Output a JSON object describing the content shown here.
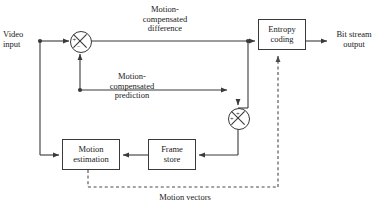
{
  "diagram": {
    "colors": {
      "line": "#3a3a3a",
      "box_stroke": "#3a3a3a",
      "box_fill": "#ffffff",
      "text": "#1a1a1a",
      "dashed": "#4a4a4a"
    },
    "labels": {
      "video_input": "Video\ninput",
      "mc_difference": "Motion-\ncompensated\ndifference",
      "mc_prediction": "Motion-\ncompensated\nprediction",
      "bit_stream_output": "Bit stream\noutput",
      "motion_vectors": "Motion vectors"
    },
    "blocks": [
      {
        "id": "entropy_coding",
        "label": "Entropy\ncoding",
        "x": 258,
        "y": 19,
        "w": 48,
        "h": 31
      },
      {
        "id": "motion_estimation",
        "label": "Motion\nestimation",
        "x": 62,
        "y": 139,
        "w": 58,
        "h": 31
      },
      {
        "id": "frame_store",
        "label": "Frame\nstore",
        "x": 148,
        "y": 139,
        "w": 48,
        "h": 31
      }
    ],
    "junctions": [
      {
        "id": "subtractor",
        "cx": 80,
        "cy": 41,
        "r": 10,
        "signs": [
          {
            "text": "+",
            "dx": -5.5,
            "dy": -1.5
          },
          {
            "text": "−",
            "dx": -1.5,
            "dy": 4.5
          }
        ]
      },
      {
        "id": "adder",
        "cx": 238,
        "cy": 118,
        "r": 10,
        "signs": [
          {
            "text": "+",
            "dx": -1.5,
            "dy": -7.5
          },
          {
            "text": "+",
            "dx": -7.5,
            "dy": -1.0
          }
        ]
      }
    ]
  }
}
